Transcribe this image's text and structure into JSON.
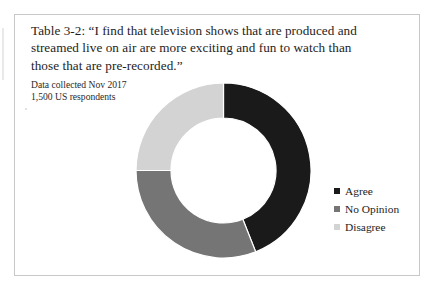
{
  "figure": {
    "caption_lines": [
      "Table 3-2: “I find that television shows that are produced and",
      "streamed live on air are more exciting and fun to watch than",
      "those that are pre-recorded.”"
    ],
    "source_lines": [
      "Data collected Nov 2017",
      "1,500 US respondents"
    ]
  },
  "chart_data": {
    "type": "pie",
    "variant": "donut",
    "title": "Table 3-2: “I find that television shows that are produced and streamed live on air are more exciting and fun to watch than those that are pre-recorded.”",
    "subtitle": "Data collected Nov 2017; 1,500 US respondents",
    "xlabel": "",
    "ylabel": "",
    "labels": [
      "Agree",
      "No Opinion",
      "Disagree"
    ],
    "values": [
      44,
      31,
      25
    ],
    "unit": "percent",
    "total": 100,
    "colors": [
      "#1a1a1a",
      "#757575",
      "#d3d3d3"
    ],
    "start_angle_deg": 0,
    "direction": "clockwise",
    "inner_radius_ratio": 0.6,
    "legend_position": "right",
    "grid": false,
    "data_labels_shown": false,
    "slices": [
      {
        "label": "Agree",
        "value": 44,
        "color": "#1a1a1a",
        "start_deg": 0,
        "end_deg": 158.4
      },
      {
        "label": "No Opinion",
        "value": 31,
        "color": "#757575",
        "start_deg": 158.4,
        "end_deg": 270.0
      },
      {
        "label": "Disagree",
        "value": 25,
        "color": "#d3d3d3",
        "start_deg": 270.0,
        "end_deg": 360.0
      }
    ]
  },
  "legend": {
    "items": [
      {
        "label": "Agree",
        "color": "#1a1a1a"
      },
      {
        "label": "No Opinion",
        "color": "#757575"
      },
      {
        "label": "Disagree",
        "color": "#d3d3d3"
      }
    ]
  },
  "style": {
    "background": "#ffffff",
    "frame_color": "#c8c8c8",
    "text_color": "#1d1d1d"
  }
}
